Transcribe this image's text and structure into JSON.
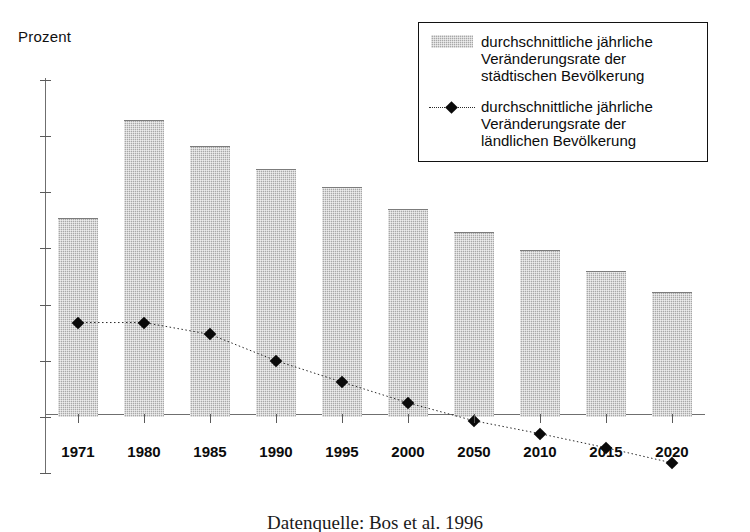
{
  "chart_data": {
    "type": "bar",
    "title": "",
    "subtitle": "",
    "ylabel": "Prozent",
    "xlabel": "",
    "ylim": [
      -1,
      6
    ],
    "yticks": [
      6,
      5,
      4,
      3,
      2,
      1,
      0,
      -1
    ],
    "ytick_labels": [
      "6",
      "5",
      "4",
      "3",
      "2",
      "1",
      "0",
      "-1"
    ],
    "grid": false,
    "legend_position": "top-right",
    "categories": [
      "1971",
      "1980",
      "1985",
      "1990",
      "1995",
      "2000",
      "2050",
      "2010",
      "2015",
      "2020"
    ],
    "series": [
      {
        "name": "durchschnittliche jährliche\nVeränderungsrate der\nstädtischen Bevölkerung",
        "type": "bar",
        "values": [
          3.55,
          5.28,
          4.82,
          4.42,
          4.1,
          3.7,
          3.3,
          2.97,
          2.6,
          2.22
        ]
      },
      {
        "name": "durchschnittliche jährliche\nVeränderungsrate der\nländlichen Bevölkerung",
        "type": "line",
        "marker": "diamond",
        "values": [
          1.68,
          1.68,
          1.47,
          1.0,
          0.62,
          0.25,
          -0.07,
          -0.3,
          -0.55,
          -0.82
        ]
      }
    ],
    "colors": {
      "bar_fill": "#a8a8a8",
      "bar_edge": "#7c7c7c",
      "line": "#2a2a2a",
      "marker": "#0a0a0a",
      "axis": "#6f6f6f",
      "text": "#0b0b0b",
      "background": "#ffffff"
    }
  },
  "legend": {
    "entries": [
      {
        "key": "bar-swatch",
        "label": "durchschnittliche jährliche\nVeränderungsrate der\nstädtischen Bevölkerung"
      },
      {
        "key": "line-marker",
        "label": "durchschnittliche jährliche\nVeränderungsrate der\nländlichen Bevölkerung"
      }
    ]
  },
  "caption": {
    "source": "Datenquelle: Bos et al. 1996"
  }
}
